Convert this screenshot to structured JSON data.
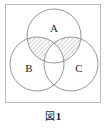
{
  "figure": {
    "caption_label": "図",
    "caption_number": "1",
    "caption_full": "図 1",
    "frame": {
      "stroke_color": "#b9b9b9",
      "fill_color": "#ffffff"
    }
  },
  "diagram": {
    "type": "venn-3-set",
    "circle_stroke_color": "#8a8a8a",
    "hatch_color": "#9a9a9a",
    "label_color": "#1f1f1f",
    "sets": [
      {
        "id": "A",
        "label": "A",
        "position": "top-center",
        "cx": 49,
        "cy": 32,
        "r": 27,
        "label_x": 49,
        "label_y": 28
      },
      {
        "id": "B",
        "label": "B",
        "position": "bottom-left",
        "cx": 32,
        "cy": 60,
        "r": 27,
        "label_x": 24,
        "label_y": 68
      },
      {
        "id": "C",
        "label": "C",
        "position": "bottom-right",
        "cx": 66,
        "cy": 60,
        "r": 27,
        "label_x": 74,
        "label_y": 68
      }
    ],
    "shaded_regions": [
      {
        "id": "A-and-B-not-C",
        "description": "A ∩ B minus C",
        "fill": "hatch-diagonal"
      },
      {
        "id": "A-and-C-not-B",
        "description": "A ∩ C minus B",
        "fill": "hatch-diagonal"
      }
    ]
  }
}
